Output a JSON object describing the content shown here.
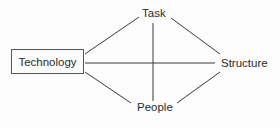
{
  "diagram": {
    "nodes": {
      "technology": "Technology",
      "task": "Task",
      "structure": "Structure",
      "people": "People"
    },
    "edges": [
      [
        "Technology",
        "Task"
      ],
      [
        "Technology",
        "Structure"
      ],
      [
        "Technology",
        "People"
      ],
      [
        "Task",
        "Structure"
      ],
      [
        "Task",
        "People"
      ],
      [
        "People",
        "Structure"
      ]
    ],
    "colors": {
      "line": "#3a3a3a",
      "text": "#2a2a2a",
      "background": "#fdfdfd"
    }
  }
}
